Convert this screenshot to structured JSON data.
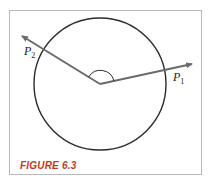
{
  "figure": {
    "caption": "FIGURE 6.3",
    "caption_color": "#c0392b",
    "frame_color": "#b9b9b9"
  },
  "diagram": {
    "circle": {
      "cx": 100,
      "cy": 84,
      "r": 66,
      "stroke": "#2b2b2b"
    },
    "center": {
      "x": 100,
      "y": 84
    },
    "rays": [
      {
        "name": "ray-p1",
        "to_x": 193,
        "to_y": 64,
        "stroke": "#6a6a6a"
      },
      {
        "name": "ray-p2",
        "to_x": 20,
        "to_y": 35,
        "stroke": "#6a6a6a"
      }
    ],
    "angle_arc": {
      "r": 14,
      "stroke": "#2b2b2b"
    },
    "points": [
      {
        "label": "P",
        "subscript": "1"
      },
      {
        "label": "P",
        "subscript": "2"
      }
    ]
  }
}
